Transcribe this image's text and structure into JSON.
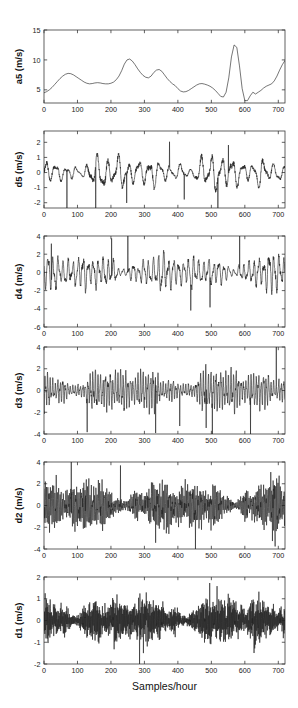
{
  "figure": {
    "width": 298,
    "height": 708,
    "background": "#ffffff",
    "line_color": "#202020",
    "axis_color": "#3a3a3a",
    "xlabel": "Samples/hour",
    "caption_top_fragment": "",
    "caption_bottom_fragment": ""
  },
  "chart_data": [
    {
      "type": "line",
      "name": "a5",
      "title": "",
      "xlabel": "",
      "ylabel": "a5 (m/s)",
      "xlim": [
        0,
        720
      ],
      "ylim": [
        2.8,
        15
      ],
      "xticks": [
        0,
        100,
        200,
        300,
        400,
        500,
        600,
        700
      ],
      "yticks": [
        5,
        10,
        15
      ],
      "grid": false,
      "x": [
        0,
        8,
        16,
        24,
        32,
        40,
        48,
        56,
        64,
        72,
        80,
        88,
        96,
        104,
        112,
        120,
        128,
        136,
        144,
        152,
        160,
        168,
        176,
        184,
        192,
        200,
        208,
        216,
        224,
        232,
        240,
        248,
        256,
        264,
        272,
        280,
        288,
        296,
        304,
        312,
        320,
        328,
        336,
        344,
        352,
        360,
        368,
        376,
        384,
        392,
        400,
        408,
        416,
        424,
        432,
        440,
        448,
        456,
        464,
        472,
        480,
        488,
        496,
        504,
        512,
        520,
        528,
        536,
        544,
        552,
        560,
        568,
        576,
        584,
        592,
        600,
        608,
        616,
        624,
        632,
        640,
        648,
        656,
        664,
        672,
        680,
        688,
        696,
        704,
        712,
        720
      ],
      "y": [
        4.5,
        4.7,
        5.0,
        5.4,
        5.9,
        6.4,
        6.9,
        7.3,
        7.6,
        7.75,
        7.7,
        7.5,
        7.2,
        6.9,
        6.6,
        6.3,
        6.1,
        6.0,
        6.05,
        6.15,
        6.2,
        6.15,
        6.05,
        6.0,
        6.0,
        6.1,
        6.3,
        6.7,
        7.3,
        8.2,
        9.3,
        10.0,
        10.15,
        9.8,
        9.2,
        8.5,
        7.9,
        7.4,
        7.1,
        7.0,
        7.3,
        7.9,
        8.3,
        8.4,
        8.1,
        7.5,
        6.9,
        6.4,
        6.0,
        5.7,
        5.2,
        4.8,
        4.65,
        4.7,
        4.9,
        5.2,
        5.5,
        5.8,
        6.0,
        6.05,
        5.95,
        5.8,
        5.6,
        5.3,
        4.9,
        4.4,
        3.9,
        3.8,
        4.6,
        7.0,
        10.5,
        12.5,
        12.1,
        9.0,
        5.2,
        3.2,
        3.2,
        4.0,
        4.6,
        4.3,
        4.6,
        4.9,
        5.3,
        5.6,
        5.8,
        6.0,
        6.5,
        7.3,
        8.3,
        9.2,
        9.9
      ]
    },
    {
      "type": "line",
      "name": "d5",
      "title": "",
      "xlabel": "",
      "ylabel": "d5 (m/s)",
      "xlim": [
        0,
        720
      ],
      "ylim": [
        -2.35,
        2.75
      ],
      "xticks": [
        0,
        100,
        200,
        300,
        400,
        500,
        600,
        700
      ],
      "yticks": [
        -2,
        -1,
        0,
        1,
        2
      ],
      "grid": false,
      "period": 31,
      "seed": 5
    },
    {
      "type": "line",
      "name": "d4",
      "title": "",
      "xlabel": "",
      "ylabel": "d4 (m/s)",
      "xlim": [
        0,
        720
      ],
      "ylim": [
        -6,
        4
      ],
      "xticks": [
        0,
        100,
        200,
        300,
        400,
        500,
        600,
        700
      ],
      "yticks": [
        -6,
        -4,
        -2,
        0,
        2,
        4
      ],
      "grid": false,
      "period": 15,
      "seed": 4
    },
    {
      "type": "line",
      "name": "d3",
      "title": "",
      "xlabel": "",
      "ylabel": "d3 (m/s)",
      "xlim": [
        0,
        720
      ],
      "ylim": [
        -4,
        4
      ],
      "xticks": [
        0,
        100,
        200,
        300,
        400,
        500,
        600,
        700
      ],
      "yticks": [
        -4,
        -2,
        0,
        2,
        4
      ],
      "grid": false,
      "period": 7.5,
      "seed": 3
    },
    {
      "type": "line",
      "name": "d2",
      "title": "",
      "xlabel": "",
      "ylabel": "d2 (m/s)",
      "xlim": [
        0,
        720
      ],
      "ylim": [
        -4,
        4
      ],
      "xticks": [
        0,
        100,
        200,
        300,
        400,
        500,
        600,
        700
      ],
      "yticks": [
        -4,
        -2,
        0,
        2,
        4
      ],
      "grid": false,
      "period": 3.6,
      "seed": 2
    },
    {
      "type": "line",
      "name": "d1",
      "title": "",
      "xlabel": "Samples/hour",
      "ylabel": "d1 (m/s)",
      "xlim": [
        0,
        720
      ],
      "ylim": [
        -2,
        2
      ],
      "xticks": [
        0,
        100,
        200,
        300,
        400,
        500,
        600,
        700
      ],
      "yticks": [
        -2,
        -1,
        0,
        1,
        2
      ],
      "grid": false,
      "period": 1.9,
      "seed": 1
    }
  ],
  "panel_geometry": [
    {
      "top": 30,
      "bottom": 103,
      "left": 44,
      "right": 285
    },
    {
      "top": 131,
      "bottom": 208,
      "left": 44,
      "right": 285
    },
    {
      "top": 236,
      "bottom": 327,
      "left": 44,
      "right": 285
    },
    {
      "top": 347,
      "bottom": 434,
      "left": 44,
      "right": 285
    },
    {
      "top": 462,
      "bottom": 549,
      "left": 44,
      "right": 285
    },
    {
      "top": 577,
      "bottom": 664,
      "left": 44,
      "right": 285
    }
  ]
}
